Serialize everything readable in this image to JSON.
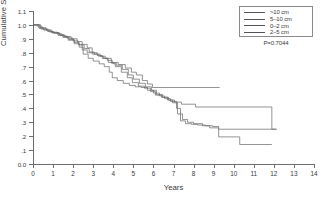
{
  "chart_data": {
    "type": "line",
    "title": "",
    "xlabel": "Years",
    "ylabel": "Cumulative Survival",
    "xlim": [
      0,
      14
    ],
    "ylim": [
      0.0,
      1.1
    ],
    "grid": false,
    "legend_position": "top-right",
    "annotations": [
      {
        "name": "p-value",
        "text": "P=0.7044"
      }
    ],
    "xticks": [
      "0",
      "1",
      "2",
      "3",
      "4",
      "5",
      "6",
      "7",
      "8",
      "9",
      "10",
      "11",
      "12",
      "13",
      "14"
    ],
    "xtick_values": [
      0,
      1,
      2,
      3,
      4,
      5,
      6,
      7,
      8,
      9,
      10,
      11,
      12,
      13,
      14
    ],
    "yticks": [
      "0.0",
      ".1",
      ".2",
      ".3",
      ".4",
      ".5",
      ".6",
      ".7",
      ".8",
      ".9",
      "1.0",
      "1.1"
    ],
    "ytick_values": [
      0.0,
      0.1,
      0.2,
      0.3,
      0.4,
      0.5,
      0.6,
      0.7,
      0.8,
      0.9,
      1.0,
      1.1
    ],
    "series": [
      {
        "name": ">10 cm",
        "legend_label": ">10 cm",
        "color": "#666666",
        "final_survival": 0.55,
        "last_time": 9.3,
        "steps": [
          [
            0.0,
            1.0
          ],
          [
            0.3,
            0.975
          ],
          [
            0.55,
            0.962
          ],
          [
            0.8,
            0.95
          ],
          [
            1.05,
            0.94
          ],
          [
            1.35,
            0.925
          ],
          [
            1.6,
            0.915
          ],
          [
            1.9,
            0.9
          ],
          [
            2.2,
            0.88
          ],
          [
            2.45,
            0.86
          ],
          [
            2.7,
            0.835
          ],
          [
            2.95,
            0.8
          ],
          [
            3.2,
            0.78
          ],
          [
            3.45,
            0.76
          ],
          [
            3.7,
            0.745
          ],
          [
            3.95,
            0.73
          ],
          [
            4.25,
            0.715
          ],
          [
            4.6,
            0.69
          ],
          [
            4.9,
            0.66
          ],
          [
            5.15,
            0.64
          ],
          [
            5.45,
            0.6
          ],
          [
            5.7,
            0.575
          ],
          [
            5.95,
            0.55
          ],
          [
            9.3,
            0.55
          ]
        ]
      },
      {
        "name": "5-10 cm",
        "legend_label": "5–10 cm",
        "color": "#666666",
        "final_survival": 0.25,
        "last_time": 11.9,
        "steps": [
          [
            0.0,
            1.0
          ],
          [
            0.25,
            0.985
          ],
          [
            0.5,
            0.97
          ],
          [
            0.75,
            0.955
          ],
          [
            1.0,
            0.945
          ],
          [
            1.3,
            0.93
          ],
          [
            1.55,
            0.915
          ],
          [
            1.8,
            0.895
          ],
          [
            2.05,
            0.875
          ],
          [
            2.3,
            0.855
          ],
          [
            2.55,
            0.83
          ],
          [
            2.8,
            0.805
          ],
          [
            3.05,
            0.79
          ],
          [
            3.35,
            0.775
          ],
          [
            3.6,
            0.76
          ],
          [
            3.9,
            0.725
          ],
          [
            4.15,
            0.71
          ],
          [
            4.45,
            0.68
          ],
          [
            4.75,
            0.64
          ],
          [
            5.0,
            0.61
          ],
          [
            5.3,
            0.58
          ],
          [
            5.6,
            0.555
          ],
          [
            5.9,
            0.53
          ],
          [
            6.15,
            0.5
          ],
          [
            6.45,
            0.48
          ],
          [
            6.75,
            0.46
          ],
          [
            7.05,
            0.445
          ],
          [
            7.4,
            0.43
          ],
          [
            8.1,
            0.41
          ],
          [
            11.9,
            0.41
          ],
          [
            11.9,
            0.25
          ],
          [
            12.15,
            0.25
          ]
        ]
      },
      {
        "name": "0-2 cm",
        "legend_label": "0–2 cm",
        "color": "#666666",
        "final_survival": 0.25,
        "last_time": 12.1,
        "steps": [
          [
            0.0,
            1.0
          ],
          [
            0.35,
            0.98
          ],
          [
            0.65,
            0.965
          ],
          [
            0.9,
            0.948
          ],
          [
            1.2,
            0.935
          ],
          [
            1.45,
            0.92
          ],
          [
            1.7,
            0.905
          ],
          [
            2.0,
            0.885
          ],
          [
            2.25,
            0.86
          ],
          [
            2.45,
            0.82
          ],
          [
            2.7,
            0.8
          ],
          [
            2.95,
            0.79
          ],
          [
            3.25,
            0.775
          ],
          [
            3.5,
            0.76
          ],
          [
            3.75,
            0.73
          ],
          [
            4.0,
            0.72
          ],
          [
            4.1,
            0.7
          ],
          [
            4.4,
            0.66
          ],
          [
            4.7,
            0.62
          ],
          [
            4.95,
            0.585
          ],
          [
            5.25,
            0.56
          ],
          [
            5.55,
            0.545
          ],
          [
            5.85,
            0.52
          ],
          [
            6.1,
            0.495
          ],
          [
            6.4,
            0.48
          ],
          [
            6.7,
            0.46
          ],
          [
            6.95,
            0.44
          ],
          [
            7.2,
            0.36
          ],
          [
            7.45,
            0.32
          ],
          [
            7.7,
            0.3
          ],
          [
            8.0,
            0.29
          ],
          [
            8.45,
            0.275
          ],
          [
            8.8,
            0.26
          ],
          [
            9.25,
            0.25
          ],
          [
            12.1,
            0.25
          ]
        ]
      },
      {
        "name": "2-5 cm",
        "legend_label": "2–5 cm",
        "color": "#666666",
        "final_survival": 0.14,
        "last_time": 11.9,
        "steps": [
          [
            0.0,
            1.0
          ],
          [
            0.4,
            0.97
          ],
          [
            0.7,
            0.955
          ],
          [
            0.95,
            0.942
          ],
          [
            1.25,
            0.925
          ],
          [
            1.5,
            0.91
          ],
          [
            1.75,
            0.89
          ],
          [
            2.05,
            0.865
          ],
          [
            2.3,
            0.84
          ],
          [
            2.5,
            0.79
          ],
          [
            2.75,
            0.76
          ],
          [
            3.0,
            0.74
          ],
          [
            3.3,
            0.72
          ],
          [
            3.55,
            0.7
          ],
          [
            3.8,
            0.66
          ],
          [
            3.95,
            0.62
          ],
          [
            4.2,
            0.6
          ],
          [
            4.5,
            0.58
          ],
          [
            4.8,
            0.565
          ],
          [
            5.1,
            0.555
          ],
          [
            5.4,
            0.55
          ],
          [
            5.7,
            0.53
          ],
          [
            6.0,
            0.51
          ],
          [
            6.3,
            0.49
          ],
          [
            6.55,
            0.47
          ],
          [
            6.85,
            0.45
          ],
          [
            7.15,
            0.4
          ],
          [
            7.35,
            0.31
          ],
          [
            7.6,
            0.29
          ],
          [
            7.9,
            0.285
          ],
          [
            8.2,
            0.28
          ],
          [
            8.6,
            0.275
          ],
          [
            8.95,
            0.27
          ],
          [
            9.25,
            0.195
          ],
          [
            10.3,
            0.195
          ],
          [
            10.3,
            0.14
          ],
          [
            11.9,
            0.14
          ]
        ]
      }
    ]
  },
  "legend": {
    "entries": [
      {
        "label": ">10 cm"
      },
      {
        "label": "5–10 cm"
      },
      {
        "label": "0–2 cm"
      },
      {
        "label": "2–5 cm"
      }
    ]
  },
  "axes": {
    "x_title": "Years",
    "y_title": "Cumulative Survival"
  },
  "stats": {
    "p_value_text": "P=0.7044"
  }
}
